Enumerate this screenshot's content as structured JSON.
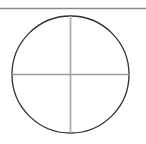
{
  "figure": {
    "caption": "",
    "background_color": "#ffffff",
    "width": 146,
    "height": 144
  },
  "top_rule": {
    "name": "horizontal-rule",
    "color": "#8a8a8a",
    "x1": 0,
    "x2": 146,
    "y": 8.5,
    "thickness": 1.6
  },
  "circle": {
    "name": "circle-outline",
    "center_x": 70.5,
    "center_y": 74.5,
    "radius": 58.5,
    "stroke_color": "#2f2f2f",
    "stroke_width": 1.3,
    "fill": "none"
  },
  "vertical_diameter": {
    "name": "vertical-diameter-line",
    "x": 70.5,
    "y1": 16,
    "y2": 133,
    "color": "#b0b0b0",
    "thickness": 1.8
  },
  "horizontal_diameter": {
    "name": "horizontal-diameter-line",
    "y": 74.5,
    "x1": 12,
    "x2": 129,
    "color": "#9a9a9a",
    "thickness": 1.3
  }
}
